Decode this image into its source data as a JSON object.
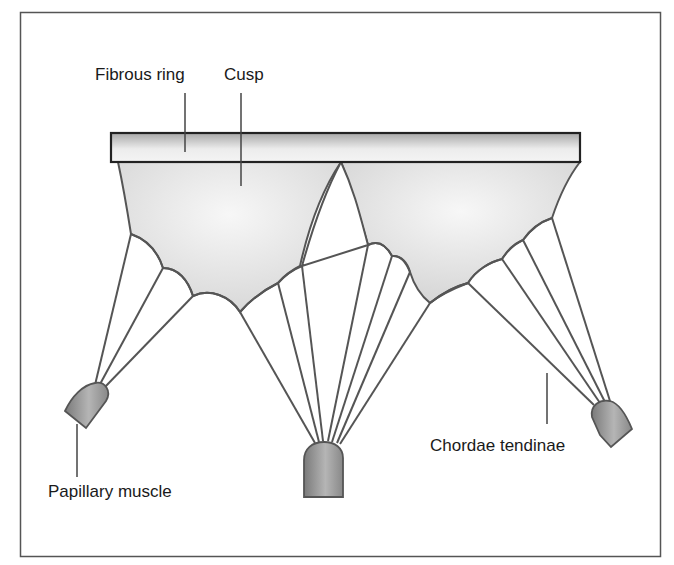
{
  "diagram": {
    "labels": {
      "fibrous_ring": "Fibrous ring",
      "cusp": "Cusp",
      "chordae_tendinae": "Chordae tendinae",
      "papillary_muscle": "Papillary muscle"
    },
    "colors": {
      "frame": "#555555",
      "outline": "#555555",
      "ring_fill_dark": "#a9a9a9",
      "ring_fill_light": "#f2f2f2",
      "cusp_fill": "#e6e6e6",
      "muscle_fill": "#8c8c8c",
      "text": "#1a1a1a"
    },
    "parts": [
      "fibrous-ring",
      "cusps",
      "chordae-tendinae",
      "papillary-muscles"
    ],
    "papillary_muscle_count": 3,
    "cusp_count": 2
  }
}
